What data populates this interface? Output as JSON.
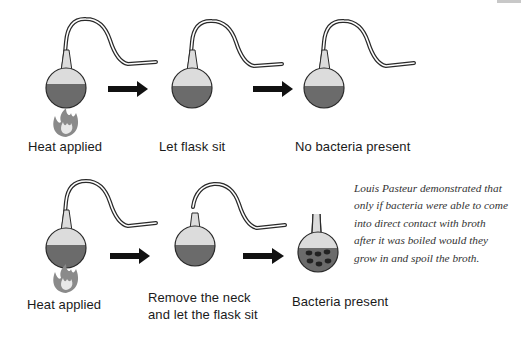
{
  "diagram": {
    "colors": {
      "liquid": "#6b6b6b",
      "flask_glass": "#dcdcdc",
      "outline": "#2a2a2a",
      "arrow": "#111111",
      "flame": "#8a8a8a",
      "bacteria": "#222222"
    },
    "rows": [
      {
        "steps": [
          {
            "label": "Heat applied",
            "flask": "swan-neck",
            "heat": true
          },
          {
            "label": "Let flask sit",
            "flask": "swan-neck",
            "heat": false
          },
          {
            "label": "No bacteria present",
            "flask": "swan-neck",
            "heat": false
          }
        ]
      },
      {
        "steps": [
          {
            "label": "Heat applied",
            "flask": "swan-neck",
            "heat": true
          },
          {
            "label_line1": "Remove the neck",
            "label_line2": "and let the flask sit",
            "flask": "broken-neck",
            "heat": false
          },
          {
            "label": "Bacteria present",
            "flask": "short-neck-with-bacteria",
            "heat": false
          }
        ]
      }
    ],
    "note": {
      "lines": [
        "Louis Pasteur demonstrated that",
        "only if bacteria were able to come",
        "into direct contact with broth",
        "after it was boiled would they",
        "grow in and spoil the broth."
      ]
    },
    "icons": [
      "flask-icon",
      "arrow-right-icon",
      "flame-icon",
      "bacteria-icon"
    ]
  }
}
